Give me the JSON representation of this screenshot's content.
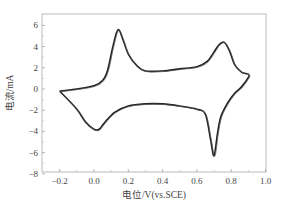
{
  "chart_data": {
    "type": "line",
    "title": "",
    "xlabel": "电位/V(vs.SCE)",
    "ylabel": "电流/mA",
    "xlim": [
      -0.3,
      1.0
    ],
    "ylim": [
      -8,
      7
    ],
    "xticks": [
      "-0.2",
      "0.0",
      "0.2",
      "0.4",
      "0.6",
      "0.8",
      "1.0"
    ],
    "yticks": [
      "6",
      "4",
      "2",
      "0",
      "-2",
      "-4",
      "-6",
      "-8"
    ],
    "grid": false,
    "legend": null,
    "series": [
      {
        "name": "cyclic voltammogram",
        "x": [
          -0.2,
          -0.1,
          0.0,
          0.05,
          0.08,
          0.11,
          0.14,
          0.17,
          0.2,
          0.25,
          0.3,
          0.4,
          0.5,
          0.6,
          0.66,
          0.7,
          0.73,
          0.76,
          0.79,
          0.82,
          0.86,
          0.9,
          0.9,
          0.86,
          0.82,
          0.78,
          0.74,
          0.72,
          0.7,
          0.68,
          0.65,
          0.6,
          0.5,
          0.4,
          0.3,
          0.2,
          0.12,
          0.06,
          0.03,
          0.0,
          -0.05,
          -0.1,
          -0.2
        ],
        "y": [
          -0.2,
          0.0,
          0.3,
          0.8,
          1.8,
          4.0,
          5.6,
          4.6,
          3.3,
          2.2,
          1.7,
          1.7,
          1.9,
          2.1,
          2.6,
          3.5,
          4.2,
          4.4,
          3.6,
          2.3,
          1.6,
          1.4,
          1.1,
          0.2,
          -0.4,
          -1.3,
          -2.6,
          -4.2,
          -6.3,
          -4.8,
          -2.4,
          -1.9,
          -1.6,
          -1.4,
          -1.4,
          -1.6,
          -2.2,
          -3.2,
          -3.8,
          -3.8,
          -3.1,
          -1.9,
          -0.2
        ]
      }
    ],
    "annotations": {
      "anodic_peaks": [
        [
          0.14,
          5.6
        ],
        [
          0.76,
          4.4
        ]
      ],
      "cathodic_peaks": [
        [
          0.7,
          -6.3
        ],
        [
          0.03,
          -3.8
        ]
      ]
    }
  }
}
